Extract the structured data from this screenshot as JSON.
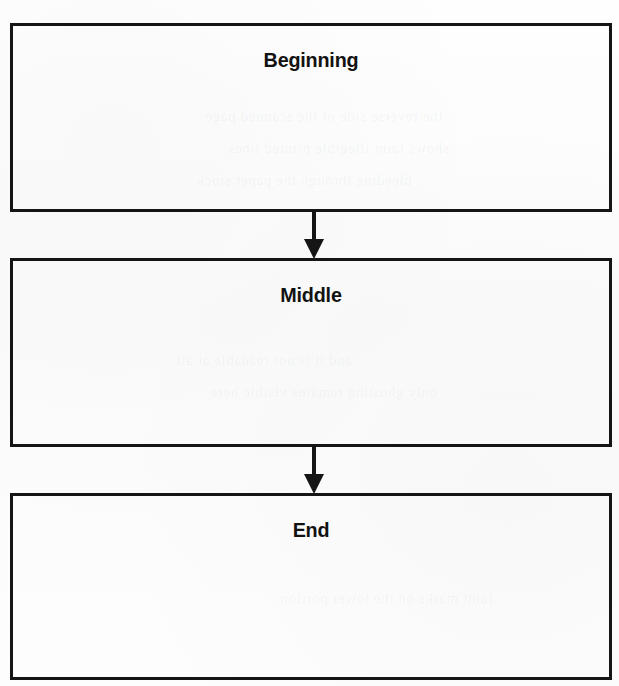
{
  "diagram": {
    "type": "flowchart",
    "orientation": "vertical",
    "background_color": "#fdfdfd",
    "stroke_color": "#151515",
    "text_color": "#121212",
    "nodes": [
      {
        "id": "beginning",
        "label": "Beginning",
        "shape": "rectangle"
      },
      {
        "id": "middle",
        "label": "Middle",
        "shape": "rectangle"
      },
      {
        "id": "end",
        "label": "End",
        "shape": "rectangle"
      }
    ],
    "connectors": [
      {
        "id": "beginning-to-middle",
        "from": "beginning",
        "to": "middle",
        "style": "solid-line-filled-arrowhead",
        "direction": "down"
      },
      {
        "id": "middle-to-end",
        "from": "middle",
        "to": "end",
        "style": "solid-line-filled-arrowhead",
        "direction": "down"
      }
    ],
    "bleed_through": [
      {
        "text": "the reverse side of the scanned page"
      },
      {
        "text": "shows faint illegible printed lines"
      },
      {
        "text": "bleeding through the paper stock"
      },
      {
        "text": "and it is not readable at all"
      },
      {
        "text": "only ghosting remains visible here"
      },
      {
        "text": "faint marks on the lower portion"
      }
    ]
  }
}
